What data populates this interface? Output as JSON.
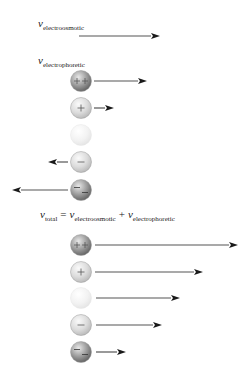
{
  "labels": {
    "electroosmotic": {
      "symbol": "v",
      "subscript": "electroosmotic"
    },
    "electrophoretic": {
      "symbol": "v",
      "subscript": "electrophoretic"
    },
    "total_equation": {
      "lhs_symbol": "v",
      "lhs_subscript": "total",
      "equals": "=",
      "term1_symbol": "v",
      "term1_subscript": "electroosmotic",
      "plus": "+",
      "term2_symbol": "v",
      "term2_subscript": "electrophoretic"
    }
  },
  "colors": {
    "arrow": "#1a1a1a",
    "arrow_shaft": "#555555"
  },
  "electroosmotic_arrow": {
    "x1": 79,
    "x2": 160,
    "y": 36
  },
  "electrophoretic_group": {
    "particles": [
      {
        "charge": "++",
        "charge_name": "double-positive",
        "cy": 81,
        "arrow_x1": 94,
        "arrow_x2": 147,
        "shade": "dark"
      },
      {
        "charge": "+",
        "charge_name": "positive",
        "cy": 108,
        "arrow_x1": 94,
        "arrow_x2": 114,
        "shade": "light"
      },
      {
        "charge": "",
        "charge_name": "neutral",
        "cy": 135,
        "arrow_x1": null,
        "arrow_x2": null,
        "shade": "faint"
      },
      {
        "charge": "−",
        "charge_name": "negative",
        "cy": 162,
        "arrow_x1": 68,
        "arrow_x2": 48,
        "shade": "light"
      },
      {
        "charge": "=",
        "charge_name": "double-negative",
        "cy": 190,
        "arrow_x1": 68,
        "arrow_x2": 12,
        "shade": "dark"
      }
    ]
  },
  "total_group": {
    "particles": [
      {
        "charge": "++",
        "charge_name": "double-positive",
        "cy": 245,
        "arrow_x1": 95,
        "arrow_x2": 238,
        "shade": "dark"
      },
      {
        "charge": "+",
        "charge_name": "positive",
        "cy": 272,
        "arrow_x1": 95,
        "arrow_x2": 203,
        "shade": "light"
      },
      {
        "charge": "",
        "charge_name": "neutral",
        "cy": 298,
        "arrow_x1": 96,
        "arrow_x2": 180,
        "shade": "faint"
      },
      {
        "charge": "−",
        "charge_name": "negative",
        "cy": 325,
        "arrow_x1": 96,
        "arrow_x2": 162,
        "shade": "light"
      },
      {
        "charge": "=",
        "charge_name": "double-negative",
        "cy": 352,
        "arrow_x1": 96,
        "arrow_x2": 126,
        "shade": "dark"
      }
    ]
  }
}
